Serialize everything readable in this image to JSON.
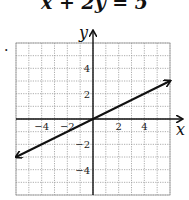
{
  "title": "x + 2y = 5",
  "bullet": ".",
  "chart_data": {
    "type": "line",
    "title": "x + 2y = 5",
    "xlabel": "x",
    "ylabel": "y",
    "xlim": [
      -6,
      6
    ],
    "ylim": [
      -6,
      6
    ],
    "grid": true,
    "x_ticks": [
      -4,
      -2,
      2,
      4
    ],
    "y_ticks": [
      4,
      2,
      -2,
      -4
    ],
    "x_tick_labels": [
      "−4",
      "−2",
      "2",
      "4"
    ],
    "y_tick_labels": [
      "4",
      "2",
      "−2",
      "−4"
    ],
    "series": [
      {
        "name": "line",
        "x": [
          -6,
          6
        ],
        "y": [
          -3,
          3
        ],
        "arrows": "both"
      }
    ]
  }
}
